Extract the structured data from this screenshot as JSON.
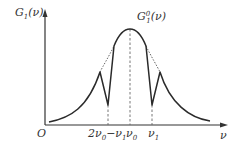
{
  "diagram": {
    "y_axis_label": "G",
    "y_axis_label_sub": "1",
    "y_axis_label_arg": "(ν)",
    "curve_label": "G",
    "curve_label_sub": "1",
    "curve_label_sup": "0",
    "curve_label_arg": "(ν)",
    "origin_label": "O",
    "x_axis_label": "ν",
    "ticks": [
      {
        "main": "2ν",
        "sub": "0",
        "rest": "−ν",
        "sub2": "1"
      },
      {
        "main": "ν",
        "sub": "0"
      },
      {
        "main": "ν",
        "sub": "1"
      }
    ],
    "colors": {
      "curve": "#2a2a2a",
      "dashed": "#555555",
      "axis": "#333333"
    }
  }
}
